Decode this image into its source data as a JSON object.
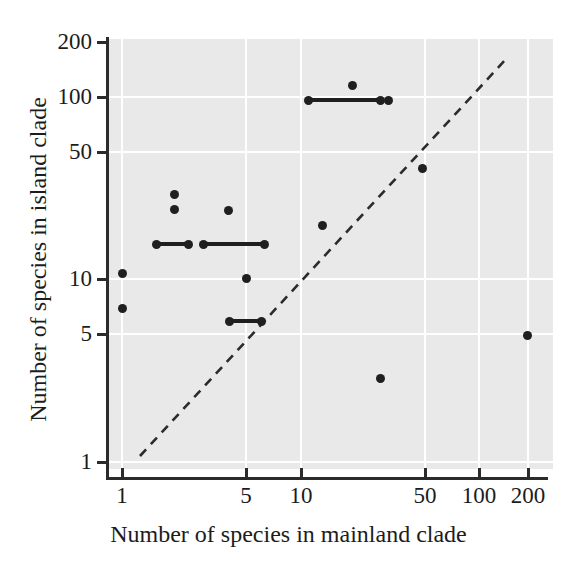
{
  "chart_data": {
    "type": "scatter",
    "title": "",
    "xlabel": "Number of species in mainland clade",
    "ylabel": "Number of species in island clade",
    "xscale": "log",
    "yscale": "log",
    "xlim": [
      1,
      260
    ],
    "ylim": [
      1,
      230
    ],
    "grid": true,
    "legend": null,
    "x_ticks": [
      {
        "value": 1,
        "label": "1",
        "px": 122
      },
      {
        "value": 5,
        "label": "5",
        "px": 246
      },
      {
        "value": 10,
        "label": "10",
        "px": 301
      },
      {
        "value": 50,
        "label": "50",
        "px": 425
      },
      {
        "value": 100,
        "label": "100",
        "px": 479
      },
      {
        "value": 200,
        "label": "200",
        "px": 528
      }
    ],
    "y_ticks": [
      {
        "value": 200,
        "label": "200",
        "px": 42
      },
      {
        "value": 100,
        "label": "100",
        "px": 97
      },
      {
        "value": 50,
        "label": "50",
        "px": 152
      },
      {
        "value": 10,
        "label": "10",
        "px": 279
      },
      {
        "value": 5,
        "label": "5",
        "px": 334
      },
      {
        "value": 1,
        "label": "1",
        "px": 462
      }
    ],
    "gridlines_x_px": [
      122,
      246,
      301,
      425,
      479,
      528
    ],
    "gridlines_y_px": [
      97,
      152,
      279,
      334,
      462
    ],
    "points": [
      {
        "x": 1,
        "y": 11,
        "px": 122,
        "py": 273
      },
      {
        "x": 1,
        "y": 7,
        "px": 122,
        "py": 308
      },
      {
        "x": 2,
        "y": 30,
        "px": 174,
        "py": 194
      },
      {
        "x": 2,
        "y": 26,
        "px": 174,
        "py": 209
      },
      {
        "x": 4,
        "y": 26,
        "px": 228,
        "py": 210
      },
      {
        "x": 5,
        "y": 10,
        "px": 246,
        "py": 278
      },
      {
        "x": 12,
        "y": 22,
        "px": 322,
        "py": 225
      },
      {
        "x": 21,
        "y": 130,
        "px": 352,
        "py": 85
      },
      {
        "x": 32,
        "y": 103,
        "px": 388,
        "py": 100
      },
      {
        "x": 49,
        "y": 45,
        "px": 422,
        "py": 168
      },
      {
        "x": 29,
        "y": 3,
        "px": 380,
        "py": 378
      },
      {
        "x": 200,
        "y": 5.2,
        "px": 527,
        "py": 335
      }
    ],
    "range_segments": [
      {
        "x_start": 11,
        "x_end": 30,
        "y": 103,
        "px_start": 308,
        "px_end": 380,
        "py": 100
      },
      {
        "x_start": 1.6,
        "x_end": 2.6,
        "y": 17,
        "px_start": 156,
        "px_end": 188,
        "py": 244
      },
      {
        "x_start": 3.1,
        "x_end": 6.2,
        "y": 17,
        "px_start": 203,
        "px_end": 264,
        "py": 244
      },
      {
        "x_start": 4.2,
        "x_end": 6.3,
        "y": 6,
        "px_start": 229,
        "px_end": 261,
        "py": 321
      }
    ],
    "reference_line": {
      "style": "dashed",
      "description": "1:1 identity line",
      "px_start": [
        140,
        456
      ],
      "px_end": [
        507,
        58
      ]
    },
    "colors": {
      "plot_background": "#e9e9e9",
      "gridline": "#ffffff",
      "marker": "#1f1f1f",
      "axis": "#2b2b2b",
      "text": "#1c1c1c",
      "page_background": "#ffffff"
    }
  }
}
